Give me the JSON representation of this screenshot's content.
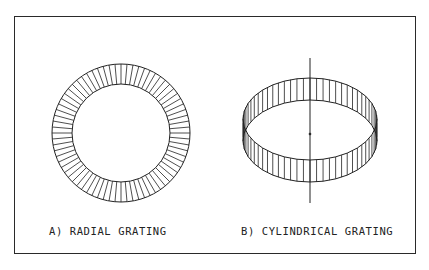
{
  "figure": {
    "panels": [
      {
        "id": "a",
        "caption": "A) RADIAL GRATING",
        "shape": "annulus",
        "segments": 72
      },
      {
        "id": "b",
        "caption": "B) CYLINDRICAL GRATING",
        "shape": "cylinder-band",
        "segments": 64
      }
    ],
    "colors": {
      "line": "#222222",
      "background": "#ffffff"
    }
  }
}
